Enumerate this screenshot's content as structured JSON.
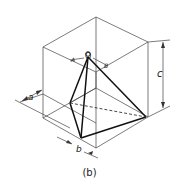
{
  "caption": "(b)",
  "labels": {
    "apex": "O",
    "edge_left": "A",
    "edge_right": "B",
    "dim_height": "c",
    "dim_left": "a",
    "dim_bottom": "b"
  },
  "colors": {
    "thin_line": "#444444",
    "thick_line": "#111111",
    "background": "#ffffff"
  }
}
